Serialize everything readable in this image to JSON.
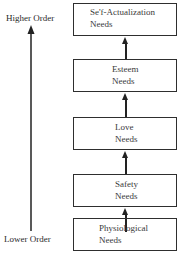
{
  "diagram": {
    "axis": {
      "top_label": "Higher Order",
      "bottom_label": "Lower Order",
      "direction": "up"
    },
    "levels": [
      {
        "line1": "Se'f-Actualization",
        "line2": "Needs"
      },
      {
        "line1": "Esteem",
        "line2": "Needs"
      },
      {
        "line1": "Love",
        "line2": "Needs"
      },
      {
        "line1": "Safety",
        "line2": "Needs"
      },
      {
        "line1": "Physiological",
        "line2": "Needs"
      }
    ],
    "colors": {
      "line": "#222222",
      "background": "#ffffff"
    }
  }
}
